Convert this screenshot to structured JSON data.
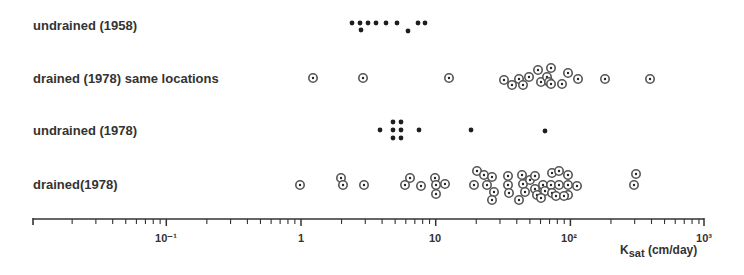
{
  "chart_data": {
    "type": "scatter",
    "title": "",
    "xlabel": "K_sat (cm/day)",
    "xlabel_main": "K",
    "xlabel_sub": "sat",
    "xlabel_unit": " (cm/day)",
    "xscale": "log",
    "xlim": [
      0.01,
      1000
    ],
    "x_ticks": [
      "10⁻¹",
      "1",
      "10",
      "10²",
      "10³"
    ],
    "x_tick_values": [
      0.1,
      1,
      10,
      100,
      1000
    ],
    "grid": false,
    "legend": "none (row labels on left)",
    "series": [
      {
        "name": "undrained (1958)",
        "marker": "filled-dot",
        "y": 25,
        "values": [
          2.3,
          2.6,
          2.65,
          2.9,
          3.3,
          3.8,
          4.4,
          6.1,
          5.2,
          7.1,
          7.9
        ]
      },
      {
        "name": "drained (1978) same locations",
        "marker": "circle-dot",
        "y": 78,
        "values": [
          1.2,
          2.8,
          12.3,
          31,
          35,
          40,
          42,
          46,
          53,
          55,
          60,
          62,
          63,
          64,
          76,
          84,
          100,
          158,
          340
        ]
      },
      {
        "name": "undrained (1978)",
        "marker": "filled-dot",
        "y": 130,
        "values": [
          4.1,
          5.0,
          5.0,
          5.0,
          5.7,
          5.7,
          5.7,
          7.6,
          18.7,
          64
        ]
      },
      {
        "name": "drained (1978)",
        "marker": "circle-dot",
        "values": [
          0.97,
          1.95,
          2.05,
          2.9,
          5.9,
          6.4,
          7.9,
          9.9,
          10.2,
          10.2,
          11.9,
          19.5,
          22,
          25,
          18.6,
          23.7,
          27.3,
          26,
          35,
          35,
          36,
          45,
          46,
          48,
          43,
          53,
          59,
          60,
          62,
          69,
          70,
          66,
          76,
          76,
          77,
          88,
          98,
          98,
          98,
          113,
          88,
          84,
          91,
          290,
          300
        ]
      }
    ]
  },
  "labels": {
    "row1": "undrained (1958)",
    "row2": "drained (1978) same locations",
    "row3": "undrained (1978)",
    "row4": "drained(1978)"
  },
  "axis": {
    "tick_m1": "10⁻¹",
    "tick_0": "1",
    "tick_1": "10",
    "tick_2": "10²",
    "tick_3": "10³",
    "xlabel_main": "K",
    "xlabel_sub": "sat",
    "xlabel_unit": " (cm/day)"
  },
  "points": {
    "filled": [
      [
        352,
        23
      ],
      [
        360,
        23
      ],
      [
        361,
        30
      ],
      [
        368,
        23
      ],
      [
        376,
        23
      ],
      [
        386,
        23
      ],
      [
        397,
        23
      ],
      [
        408,
        31
      ],
      [
        418,
        23
      ],
      [
        425,
        23
      ],
      [
        380,
        130
      ],
      [
        393,
        122
      ],
      [
        393,
        130
      ],
      [
        393,
        138
      ],
      [
        401,
        122
      ],
      [
        401,
        130
      ],
      [
        401,
        138
      ],
      [
        419,
        130
      ],
      [
        471,
        130
      ],
      [
        545,
        131
      ]
    ],
    "circled": [
      [
        313,
        78
      ],
      [
        363,
        78
      ],
      [
        449,
        78
      ],
      [
        504,
        80
      ],
      [
        512,
        85
      ],
      [
        519,
        79
      ],
      [
        523,
        85
      ],
      [
        529,
        77
      ],
      [
        538,
        70
      ],
      [
        541,
        82
      ],
      [
        547,
        77
      ],
      [
        549,
        82
      ],
      [
        551,
        84
      ],
      [
        551,
        68
      ],
      [
        562,
        84
      ],
      [
        568,
        73
      ],
      [
        578,
        79
      ],
      [
        605,
        79
      ],
      [
        650,
        79
      ],
      [
        300,
        185
      ],
      [
        341,
        178
      ],
      [
        343,
        185
      ],
      [
        364,
        185
      ],
      [
        405,
        185
      ],
      [
        410,
        178
      ],
      [
        421,
        186
      ],
      [
        435,
        178
      ],
      [
        436,
        185
      ],
      [
        436,
        194
      ],
      [
        445,
        184
      ],
      [
        477,
        171
      ],
      [
        484,
        175
      ],
      [
        492,
        177
      ],
      [
        474,
        185
      ],
      [
        487,
        185
      ],
      [
        494,
        192
      ],
      [
        492,
        200
      ],
      [
        508,
        176
      ],
      [
        508,
        185
      ],
      [
        509,
        193
      ],
      [
        522,
        175
      ],
      [
        523,
        184
      ],
      [
        525,
        192
      ],
      [
        519,
        200
      ],
      [
        530,
        180
      ],
      [
        535,
        176
      ],
      [
        535,
        189
      ],
      [
        537,
        195
      ],
      [
        543,
        185
      ],
      [
        545,
        191
      ],
      [
        541,
        198
      ],
      [
        551,
        185
      ],
      [
        552,
        193
      ],
      [
        552,
        173
      ],
      [
        559,
        171
      ],
      [
        568,
        175
      ],
      [
        568,
        185
      ],
      [
        568,
        195
      ],
      [
        577,
        186
      ],
      [
        559,
        185
      ],
      [
        556,
        196
      ],
      [
        564,
        196
      ],
      [
        636,
        174
      ],
      [
        634,
        185
      ]
    ]
  }
}
